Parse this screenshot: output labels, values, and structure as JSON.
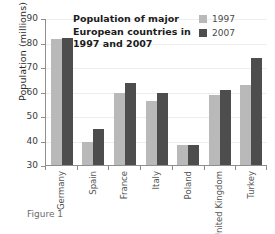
{
  "caption": "Figure 1",
  "legend": {
    "position": "top-right",
    "items": [
      {
        "label": "1997",
        "color": "#b9b9b9"
      },
      {
        "label": "2007",
        "color": "#4d4d4d"
      }
    ]
  },
  "chart_data": {
    "type": "bar",
    "title": "Population of major\nEuropean countries in\n1997 and 2007",
    "xlabel": "",
    "ylabel": "Population (millions)",
    "ylim": [
      30,
      90
    ],
    "yticks": [
      90,
      80,
      70,
      60,
      50,
      40,
      30
    ],
    "ytick_labels": [
      "90",
      "80",
      "70",
      "60",
      "50",
      "40",
      "30"
    ],
    "grid": true,
    "legend_position": "top-right",
    "categories": [
      "Germany",
      "Spain",
      "France",
      "Italy",
      "Poland",
      "United Kingdom",
      "Turkey"
    ],
    "series": [
      {
        "name": "1997",
        "color": "#b9b9b9",
        "values": [
          81.5,
          39.5,
          59.5,
          56.0,
          38.0,
          58.5,
          62.5
        ]
      },
      {
        "name": "2007",
        "color": "#4d4d4d",
        "values": [
          82.0,
          44.5,
          63.5,
          59.5,
          38.3,
          60.5,
          73.5
        ]
      }
    ]
  }
}
